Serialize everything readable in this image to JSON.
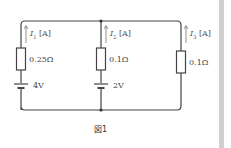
{
  "figure": {
    "caption": "図1",
    "branches": [
      {
        "current_label": "I",
        "current_sub": "1",
        "unit": "[A]",
        "resistance": "0.25Ω",
        "emf": "4V"
      },
      {
        "current_label": "I",
        "current_sub": "2",
        "unit": "[A]",
        "resistance": "0.1Ω",
        "emf": "2V"
      },
      {
        "current_label": "I",
        "current_sub": "3",
        "unit": "[A]",
        "resistance": "0.1Ω",
        "emf": null
      }
    ]
  },
  "colors": {
    "wire": "#444444",
    "arrow": "#777777",
    "frame": "#cfcfcf"
  }
}
